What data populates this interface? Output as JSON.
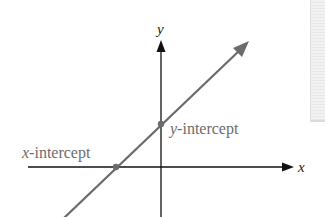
{
  "diagram": {
    "axes": {
      "x_label": "x",
      "y_label": "y"
    },
    "labels": {
      "x_intercept_var": "x",
      "x_intercept_text": "-intercept",
      "y_intercept_var": "y",
      "y_intercept_text": "-intercept"
    },
    "colors": {
      "axis": "#111111",
      "line": "#6b6b6b",
      "point": "#6b6b6b",
      "label_text": "#6b6b6b",
      "axis_label": "#222222"
    }
  }
}
